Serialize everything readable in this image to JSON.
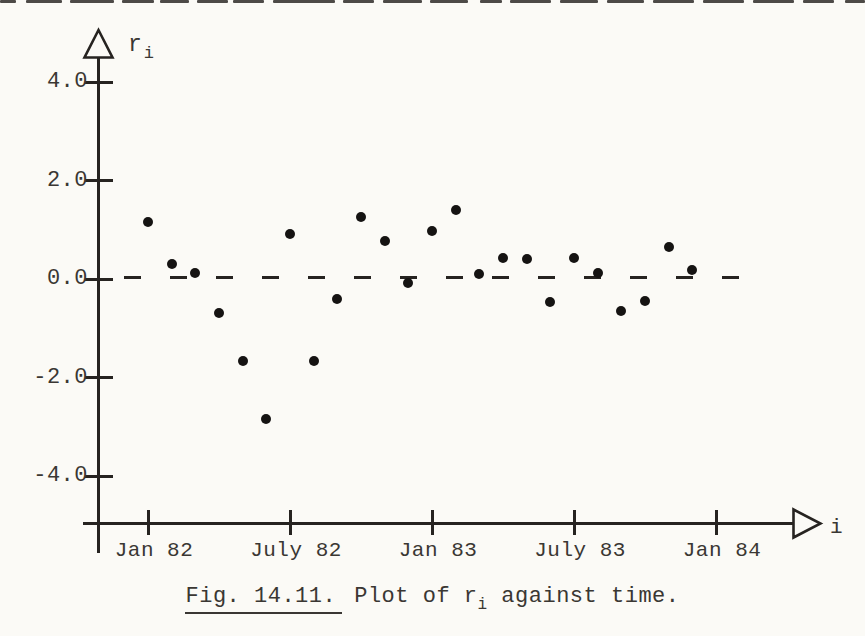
{
  "figure": {
    "caption_label": "Fig. 14.11.",
    "caption_pre": "Plot of r",
    "caption_sub": "i",
    "caption_tail": " against time."
  },
  "axes": {
    "y_label_main": "r",
    "y_label_sub": "i",
    "x_label": "i",
    "y_ticks": [
      {
        "label": "4.0",
        "value": 4.0
      },
      {
        "label": "2.0",
        "value": 2.0
      },
      {
        "label": "0.0",
        "value": 0.0
      },
      {
        "label": "-2.0",
        "value": -2.0
      },
      {
        "label": "-4.0",
        "value": -4.0
      }
    ],
    "x_ticks": [
      {
        "label": "Jan 82",
        "month": 0
      },
      {
        "label": "July 82",
        "month": 6
      },
      {
        "label": "Jan 83",
        "month": 12
      },
      {
        "label": "July 83",
        "month": 18
      },
      {
        "label": "Jan 84",
        "month": 24
      }
    ]
  },
  "chart_data": {
    "type": "scatter",
    "xlabel": "i",
    "ylabel": "r_i",
    "ylim": [
      -5,
      5
    ],
    "x_tick_labels": [
      "Jan 82",
      "July 82",
      "Jan 83",
      "July 83",
      "Jan 84"
    ],
    "zero_line_style": "dashed",
    "grid": false,
    "legend": false,
    "points": [
      {
        "month": "Jan 82",
        "value": 1.15
      },
      {
        "month": "Feb 82",
        "value": 0.3
      },
      {
        "month": "Mar 82",
        "value": 0.12
      },
      {
        "month": "Apr 82",
        "value": -0.7
      },
      {
        "month": "May 82",
        "value": -1.67
      },
      {
        "month": "Jun 82",
        "value": -2.85
      },
      {
        "month": "July 82",
        "value": 0.92
      },
      {
        "month": "Aug 82",
        "value": -1.67
      },
      {
        "month": "Sep 82",
        "value": -0.4
      },
      {
        "month": "Oct 82",
        "value": 1.25
      },
      {
        "month": "Nov 82",
        "value": 0.77
      },
      {
        "month": "Dec 82",
        "value": -0.08
      },
      {
        "month": "Jan 83",
        "value": 0.97
      },
      {
        "month": "Feb 83",
        "value": 1.4
      },
      {
        "month": "Mar 83",
        "value": 0.1
      },
      {
        "month": "Apr 83",
        "value": 0.43
      },
      {
        "month": "May 83",
        "value": 0.41
      },
      {
        "month": "Jun 83",
        "value": -0.47
      },
      {
        "month": "July 83",
        "value": 0.43
      },
      {
        "month": "Aug 83",
        "value": 0.12
      },
      {
        "month": "Sep 83",
        "value": -0.65
      },
      {
        "month": "Oct 83",
        "value": -0.45
      },
      {
        "month": "Nov 83",
        "value": 0.65
      },
      {
        "month": "Dec 83",
        "value": 0.18
      }
    ]
  },
  "colors": {
    "paper": "#fbfaf6",
    "ink": "#262320",
    "point": "#151312"
  },
  "scan_artifacts": {
    "top_strip_segments": [
      [
        0,
        16
      ],
      [
        26,
        36
      ],
      [
        70,
        44
      ],
      [
        122,
        32
      ],
      [
        160,
        29
      ],
      [
        197,
        31
      ],
      [
        233,
        31
      ],
      [
        273,
        62
      ],
      [
        343,
        31
      ],
      [
        383,
        39
      ],
      [
        430,
        38
      ],
      [
        480,
        22
      ],
      [
        510,
        41
      ],
      [
        560,
        38
      ],
      [
        607,
        37
      ],
      [
        653,
        41
      ],
      [
        703,
        41
      ],
      [
        753,
        41
      ],
      [
        803,
        31
      ],
      [
        845,
        20
      ]
    ]
  }
}
